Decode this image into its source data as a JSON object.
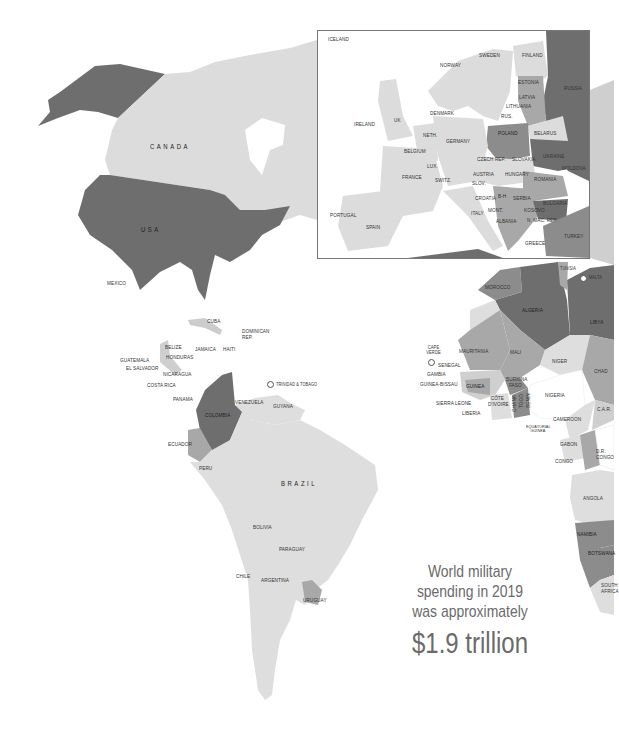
{
  "colors": {
    "background": "#ffffff",
    "tier_highest": "#6e6e6e",
    "tier_high": "#8c8c8c",
    "tier_mid": "#a8a8a8",
    "tier_low": "#cfcfcf",
    "tier_lowest": "#dedede",
    "no_data": "#ffffff",
    "label": "#333333",
    "caption": "#6a6a6a",
    "inset_border": "#777777"
  },
  "caption": {
    "line1": "World military",
    "line2": "spending in 2019",
    "line3": "was approximately",
    "amount": "$1.9 trillion"
  },
  "americas": {
    "canada": "CANADA",
    "usa": "USA",
    "mexico": "MEXICO",
    "cuba": "CUBA",
    "dominican_rep": "DOMINICAN REP.",
    "belize": "BELIZE",
    "jamaica": "JAMAICA",
    "haiti": "HAITI",
    "guatemala": "GUATEMALA",
    "honduras": "HONDURAS",
    "el_salvador": "EL SALVADOR",
    "nicaragua": "NICARAGUA",
    "costa_rica": "COSTA RICA",
    "panama": "PANAMA",
    "trinidad": "TRINIDAD & TOBAGO",
    "venezuela": "VENEZUELA",
    "guyana": "GUYANA",
    "colombia": "COLOMBIA",
    "ecuador": "ECUADOR",
    "peru": "PERU",
    "brazil": "BRAZIL",
    "bolivia": "BOLIVIA",
    "paraguay": "PARAGUAY",
    "chile": "CHILE",
    "argentina": "ARGENTINA",
    "uruguay": "URUGUAY"
  },
  "europe_inset": {
    "iceland": "ICELAND",
    "norway": "NORWAY",
    "sweden": "SWEDEN",
    "finland": "FINLAND",
    "estonia": "ESTONIA",
    "russia": "RUSSIA",
    "latvia": "LATVIA",
    "lithuania": "LITHUANIA",
    "rus": "RUS.",
    "denmark": "DENMARK",
    "ireland": "IRELAND",
    "uk": "UK",
    "neth": "NETH.",
    "germany": "GERMANY",
    "poland": "POLAND",
    "belarus": "BELARUS",
    "belgium": "BELGIUM",
    "lux": "LUX.",
    "czech_rep": "CZECH REP.",
    "slovakia": "SLOVAKIA",
    "ukraine": "UKRAINE",
    "france": "FRANCE",
    "switz": "SWITZ.",
    "austria": "AUSTRIA",
    "slov": "SLOV.",
    "hungary": "HUNGARY",
    "moldova": "MOLDOVA",
    "romania": "ROMANIA",
    "croatia": "CROATIA",
    "bh": "B-H",
    "serbia": "SERBIA",
    "bulgaria": "BULGARIA",
    "portugal": "PORTUGAL",
    "spain": "SPAIN",
    "italy": "ITALY",
    "mont": "MONT.",
    "kosovo": "KOSOVO",
    "albania": "ALBANIA",
    "n_mac": "N. MAC. REP.",
    "turkey": "TURKEY",
    "greece": "GREECE"
  },
  "africa": {
    "tunisia": "TUNISIA",
    "malta": "MALTA",
    "morocco": "MOROCCO",
    "algeria": "ALGERIA",
    "libya": "LIBYA",
    "cape_verde": "CAPE VERDE",
    "mauritania": "MAURITANIA",
    "mali": "MALI",
    "niger": "NIGER",
    "chad": "CHAD",
    "senegal": "SENEGAL",
    "gambia": "GAMBIA",
    "guinea_bissau": "GUINEA-BISSAU",
    "guinea": "GUINEA",
    "burkina": "BURKINA FASO",
    "sierra_leone": "SIERRA LEONE",
    "liberia": "LIBERIA",
    "cote": "CÔTE D'IVOIRE",
    "ghana": "GHANA",
    "togo": "TOGO",
    "benin": "BENIN",
    "nigeria": "NIGERIA",
    "car": "C.A.R.",
    "cameroon": "CAMEROON",
    "eq_guinea": "EQUATORIAL GUINEA",
    "gabon": "GABON",
    "congo": "CONGO",
    "dr_congo": "D.R. CONGO",
    "angola": "ANGOLA",
    "namibia": "NAMIBIA",
    "botswana": "BOTSWANA",
    "south_africa": "SOUTH AFRICA"
  }
}
